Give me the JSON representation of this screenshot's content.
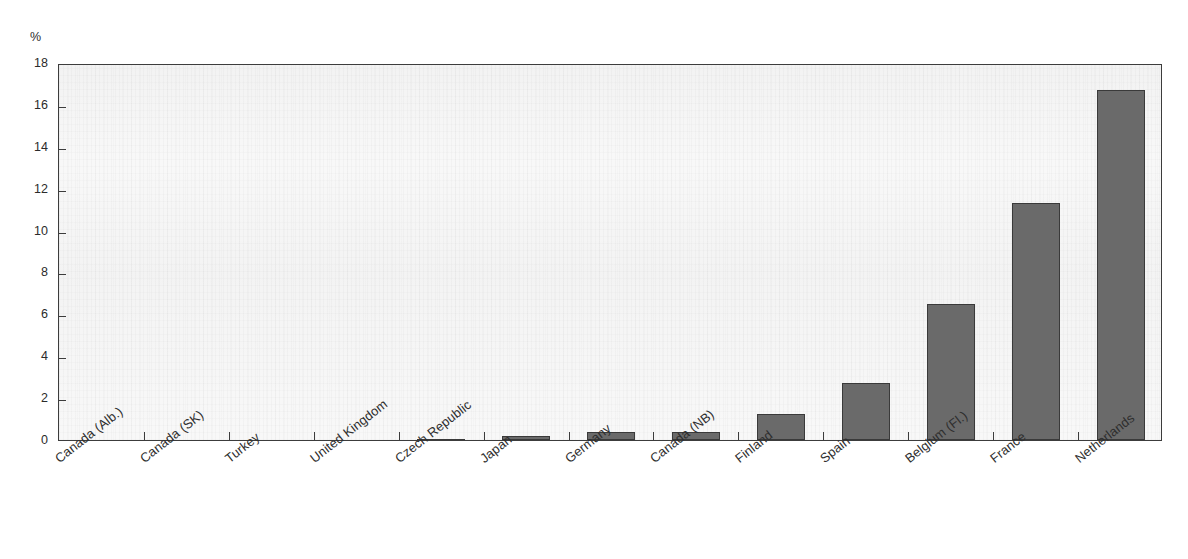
{
  "chart_data": {
    "type": "bar",
    "title": "",
    "subtitle": "",
    "unit_label": "%",
    "xlabel": "",
    "ylabel": "",
    "ylim": [
      0,
      18
    ],
    "ytick_step": 2,
    "yticks": [
      "0",
      "2",
      "4",
      "6",
      "8",
      "10",
      "12",
      "14",
      "16",
      "18"
    ],
    "grid": false,
    "legend": null,
    "bar_color": "#6a6a6a",
    "bar_edge_color": "#3a3a3a",
    "axis_color": "#3c3c3c",
    "plot_background": "#fbfbfb",
    "categories": [
      "Canada (Alb.)",
      "Canada (SK)",
      "Turkey",
      "United Kingdom",
      "Czech Republic",
      "Japan",
      "Germany",
      "Canada (NB)",
      "Finland",
      "Spain",
      "Belgium (Fl.)",
      "France",
      "Netherlands"
    ],
    "values": [
      0,
      0,
      0,
      0,
      0.07,
      0.2,
      0.4,
      0.4,
      1.25,
      2.7,
      6.5,
      11.3,
      16.7
    ],
    "annotations": []
  }
}
